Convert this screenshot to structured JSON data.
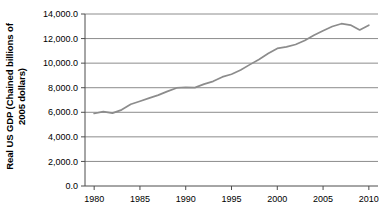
{
  "chart_data": {
    "type": "line",
    "title": "",
    "subtitle": "",
    "xlabel": "",
    "ylabel": "Real US GDP (Chained billions of 2005 dollars)",
    "ylabel_line1": "Real US GDP (Chained billions of",
    "ylabel_line2": "2005 dollars)",
    "xlim": [
      1979,
      2011
    ],
    "ylim": [
      0,
      14000
    ],
    "grid": true,
    "legend": false,
    "legend_position": "none",
    "line_color": "#8c8c8c",
    "axis_color": "#4d4d4d",
    "grid_color": "#8c8c8c",
    "y_ticks": [
      0,
      2000,
      4000,
      6000,
      8000,
      10000,
      12000,
      14000
    ],
    "y_tick_labels": [
      "0.0",
      "2,000.0",
      "4,000.0",
      "6,000.0",
      "8,000.0",
      "10,000.0",
      "12,000.0",
      "14,000.0"
    ],
    "x_ticks": [
      1980,
      1985,
      1990,
      1995,
      2000,
      2005,
      2010
    ],
    "x_tick_labels": [
      "1980",
      "1985",
      "1990",
      "1995",
      "2000",
      "2005",
      "2010"
    ],
    "series": [
      {
        "name": "Real US GDP",
        "x": [
          1980,
          1981,
          1982,
          1983,
          1984,
          1985,
          1986,
          1987,
          1988,
          1989,
          1990,
          1991,
          1992,
          1993,
          1994,
          1995,
          1996,
          1997,
          1998,
          1999,
          2000,
          2001,
          2002,
          2003,
          2004,
          2005,
          2006,
          2007,
          2008,
          2009,
          2010
        ],
        "values": [
          5900,
          6050,
          5930,
          6200,
          6650,
          6900,
          7150,
          7400,
          7700,
          7980,
          8030,
          8010,
          8290,
          8520,
          8880,
          9100,
          9450,
          9880,
          10300,
          10780,
          11200,
          11320,
          11520,
          11840,
          12270,
          12640,
          12980,
          13210,
          13100,
          12700,
          13090
        ]
      }
    ]
  }
}
